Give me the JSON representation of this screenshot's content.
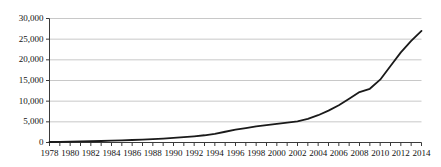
{
  "chart_data": {
    "type": "line",
    "title": "",
    "subtitle": "",
    "xlabel": "",
    "ylabel": "",
    "grid": true,
    "legend": false,
    "legend_position": "none",
    "xlim": [
      1978,
      2014
    ],
    "ylim": [
      0,
      30000
    ],
    "ytick_labels": [
      "0",
      "5,000",
      "10,000",
      "15,000",
      "20,000",
      "25,000",
      "30,000"
    ],
    "ytick_values": [
      0,
      5000,
      10000,
      15000,
      20000,
      25000,
      30000
    ],
    "xtick_labels": [
      "1978",
      "1980",
      "1982",
      "1984",
      "1986",
      "1988",
      "1990",
      "1992",
      "1994",
      "1996",
      "1998",
      "2000",
      "2002",
      "2004",
      "2006",
      "2008",
      "2010",
      "2012",
      "2014"
    ],
    "xtick_values": [
      1978,
      1980,
      1982,
      1984,
      1986,
      1988,
      1990,
      1992,
      1994,
      1996,
      1998,
      2000,
      2002,
      2004,
      2006,
      2008,
      2010,
      2012,
      2014
    ],
    "minor_xticks": [
      1978,
      1979,
      1980,
      1981,
      1982,
      1983,
      1984,
      1985,
      1986,
      1987,
      1988,
      1989,
      1990,
      1991,
      1992,
      1993,
      1994,
      1995,
      1996,
      1997,
      1998,
      1999,
      2000,
      2001,
      2002,
      2003,
      2004,
      2005,
      2006,
      2007,
      2008,
      2009,
      2010,
      2011,
      2012,
      2013,
      2014
    ],
    "x": [
      1978,
      1979,
      1980,
      1981,
      1982,
      1983,
      1984,
      1985,
      1986,
      1987,
      1988,
      1989,
      1990,
      1991,
      1992,
      1993,
      1994,
      1995,
      1996,
      1997,
      1998,
      1999,
      2000,
      2001,
      2002,
      2003,
      2004,
      2005,
      2006,
      2007,
      2008,
      2009,
      2010,
      2011,
      2012,
      2013,
      2014
    ],
    "values": [
      120,
      160,
      200,
      250,
      300,
      360,
      430,
      510,
      600,
      700,
      820,
      950,
      1100,
      1300,
      1500,
      1750,
      2100,
      2600,
      3100,
      3500,
      3900,
      4200,
      4500,
      4800,
      5100,
      5700,
      6600,
      7700,
      9000,
      10600,
      12200,
      13000,
      15200,
      18500,
      21800,
      24600,
      27000
    ],
    "series": [
      {
        "name": "series-1",
        "color": "#1a1a1a",
        "values": [
          120,
          160,
          200,
          250,
          300,
          360,
          430,
          510,
          600,
          700,
          820,
          950,
          1100,
          1300,
          1500,
          1750,
          2100,
          2600,
          3100,
          3500,
          3900,
          4200,
          4500,
          4800,
          5100,
          5700,
          6600,
          7700,
          9000,
          10600,
          12200,
          13000,
          15200,
          18500,
          21800,
          24600,
          27000
        ]
      }
    ],
    "colors": {
      "line": "#1a1a1a",
      "grid": "#c8c8c8",
      "axis": "#3a3a3a",
      "background": "#ffffff",
      "text": "#111111"
    },
    "annotations": []
  }
}
